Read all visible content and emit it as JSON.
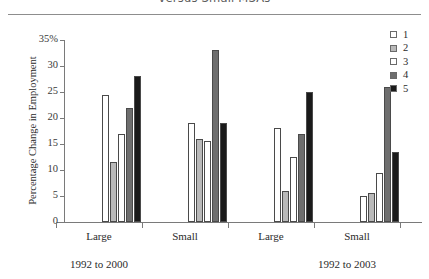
{
  "title": "versus Small MSAs",
  "chart_data": {
    "type": "bar",
    "title": "versus Small MSAs",
    "xlabel": "",
    "ylabel": "Percentage Change in Employment",
    "ylim": [
      0,
      35
    ],
    "yticks": [
      "0",
      "5",
      "10",
      "15",
      "20",
      "25",
      "30",
      "35%"
    ],
    "grid": false,
    "legend_position": "right",
    "categories": [
      "Large",
      "Small",
      "Large",
      "Small"
    ],
    "groups": [
      {
        "label": "Large",
        "period": "1992 to 2000"
      },
      {
        "label": "Small",
        "period": "1992 to 2000"
      },
      {
        "label": "Large",
        "period": "1992 to 2003"
      },
      {
        "label": "Small",
        "period": "1992 to 2003"
      }
    ],
    "period_labels": [
      "1992 to 2000",
      "1992 to 2003"
    ],
    "series": [
      {
        "name": "1",
        "color": "#ffffff",
        "values": [
          24.5,
          19.0,
          18.0,
          5.0
        ]
      },
      {
        "name": "2",
        "color": "#b9b9b9",
        "values": [
          11.5,
          16.0,
          6.0,
          5.5
        ]
      },
      {
        "name": "3",
        "color": "#ffffff",
        "values": [
          17.0,
          15.5,
          12.5,
          9.5
        ]
      },
      {
        "name": "4",
        "color": "#6e6e6e",
        "values": [
          22.0,
          33.0,
          17.0,
          26.0
        ]
      },
      {
        "name": "5",
        "color": "#1a1a1a",
        "values": [
          28.0,
          19.0,
          25.0,
          13.5
        ]
      }
    ]
  },
  "legend": {
    "entries": [
      {
        "label": "1",
        "color": "#ffffff"
      },
      {
        "label": "2",
        "color": "#b9b9b9"
      },
      {
        "label": "3",
        "color": "#ffffff"
      },
      {
        "label": "4",
        "color": "#6e6e6e"
      },
      {
        "label": "5",
        "color": "#1a1a1a"
      }
    ]
  }
}
